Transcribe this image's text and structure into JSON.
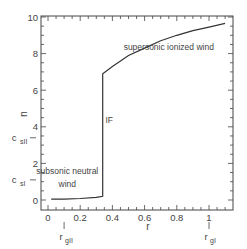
{
  "chart_data": {
    "type": "line",
    "title": "",
    "xlabel": "r",
    "ylabel": "u",
    "xlim": [
      -0.05,
      1.15
    ],
    "ylim": [
      -0.5,
      10
    ],
    "xticks": [
      0,
      0.2,
      0.4,
      0.6,
      0.8,
      1
    ],
    "xtick_labels": [
      "0",
      "0.2",
      "0.4",
      "0.6",
      "0.8",
      "1"
    ],
    "yticks": [
      0,
      2,
      4,
      6,
      8,
      10
    ],
    "ytick_labels": [
      "0",
      "2",
      "4",
      "6",
      "8",
      "10"
    ],
    "grid": false,
    "series": [
      {
        "name": "velocity",
        "x": [
          0.02,
          0.1,
          0.2,
          0.3,
          0.34,
          0.34,
          0.4,
          0.5,
          0.6,
          0.7,
          0.8,
          0.9,
          1.0,
          1.1
        ],
        "y": [
          0.05,
          0.05,
          0.08,
          0.15,
          0.2,
          6.9,
          7.3,
          7.9,
          8.3,
          8.7,
          9.0,
          9.25,
          9.45,
          9.65
        ]
      }
    ],
    "annotations": [
      {
        "text": "supersonic ionized wind",
        "x": 0.75,
        "y": 8.2
      },
      {
        "text": "IF",
        "x": 0.38,
        "y": 4.2
      },
      {
        "text": "subsonic neutral",
        "x": 0.12,
        "y": 1.4
      },
      {
        "text": "wind",
        "x": 0.12,
        "y": 0.7
      }
    ],
    "extra_axis_labels": {
      "y": [
        {
          "text": "c_sII",
          "main": "c",
          "sub": "s",
          "subsub": "II",
          "value": 3.4
        },
        {
          "text": "c_sI",
          "main": "c",
          "sub": "s",
          "subsub": "I",
          "value": 1.1
        }
      ],
      "x": [
        {
          "main": "r",
          "sub": "g",
          "subsub": "II",
          "value": 0.1
        },
        {
          "main": "r",
          "sub": "g",
          "subsub": "I",
          "value": 1.0
        }
      ]
    }
  }
}
